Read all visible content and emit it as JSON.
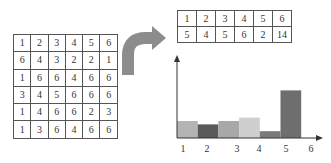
{
  "dice_grid": {
    "rows": [
      [
        1,
        2,
        3,
        4,
        5,
        6
      ],
      [
        6,
        4,
        3,
        2,
        2,
        1
      ],
      [
        1,
        6,
        6,
        4,
        6,
        6
      ],
      [
        3,
        4,
        5,
        6,
        6,
        6
      ],
      [
        1,
        4,
        6,
        6,
        2,
        3
      ],
      [
        1,
        3,
        6,
        4,
        6,
        6
      ]
    ]
  },
  "frequency_table": {
    "values": [
      1,
      2,
      3,
      4,
      5,
      6
    ],
    "counts": [
      5,
      4,
      5,
      6,
      2,
      14
    ]
  },
  "chart_data": {
    "type": "bar",
    "title": "",
    "xlabel": "",
    "ylabel": "",
    "categories": [
      "1",
      "2",
      "3",
      "4",
      "5",
      "6"
    ],
    "values": [
      5,
      4,
      5,
      6,
      2,
      14
    ],
    "colors": [
      "#b4b4b4",
      "#5a5a5a",
      "#a8a8a8",
      "#cfcfcf",
      "#7a7a7a",
      "#6e6e6e"
    ],
    "x_tick_labels": [
      "1",
      "2",
      "3",
      "4",
      "5",
      "6"
    ],
    "grid": false,
    "axis_arrows": true
  },
  "colors": {
    "arrow": "#8c8c8c",
    "border": "#555555",
    "axis": "#333333"
  }
}
